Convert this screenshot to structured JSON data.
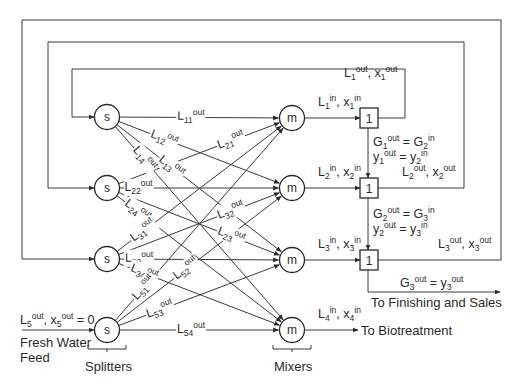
{
  "diagram": {
    "splitters": [
      {
        "id": "s1",
        "label": "s",
        "cx": 107,
        "cy": 117
      },
      {
        "id": "s2",
        "label": "s",
        "cx": 107,
        "cy": 188
      },
      {
        "id": "s3",
        "label": "s",
        "cx": 107,
        "cy": 259
      },
      {
        "id": "s5",
        "label": "s",
        "cx": 107,
        "cy": 330
      }
    ],
    "mixers": [
      {
        "id": "m1",
        "label": "m",
        "cx": 292,
        "cy": 118
      },
      {
        "id": "m2",
        "label": "m",
        "cx": 292,
        "cy": 188
      },
      {
        "id": "m3",
        "label": "m",
        "cx": 292,
        "cy": 260
      },
      {
        "id": "m4",
        "label": "m",
        "cx": 292,
        "cy": 330
      }
    ],
    "stages": [
      {
        "id": "u1",
        "label": "1",
        "cx": 369,
        "cy": 118
      },
      {
        "id": "u2",
        "label": "1",
        "cx": 369,
        "cy": 188
      },
      {
        "id": "u3",
        "label": "1",
        "cx": 369,
        "cy": 260
      }
    ],
    "streams": [
      {
        "from": "s1",
        "to": "m1",
        "base": "L",
        "sub": "11",
        "sup": "out"
      },
      {
        "from": "s1",
        "to": "m2",
        "base": "L",
        "sub": "12",
        "sup": "out"
      },
      {
        "from": "s1",
        "to": "m3",
        "base": "L",
        "sub": "13",
        "sup": "out"
      },
      {
        "from": "s1",
        "to": "m4",
        "base": "L",
        "sub": "14",
        "sup": "out"
      },
      {
        "from": "s2",
        "to": "m1",
        "base": "L",
        "sub": "21",
        "sup": "out"
      },
      {
        "from": "s2",
        "to": "m2",
        "base": "L",
        "sub": "22",
        "sup": "out"
      },
      {
        "from": "s2",
        "to": "m3",
        "base": "L",
        "sub": "23",
        "sup": "out"
      },
      {
        "from": "s2",
        "to": "m4",
        "base": "L",
        "sub": "24",
        "sup": "out"
      },
      {
        "from": "s3",
        "to": "m1",
        "base": "L",
        "sub": "31",
        "sup": "out"
      },
      {
        "from": "s3",
        "to": "m2",
        "base": "L",
        "sub": "32",
        "sup": "out"
      },
      {
        "from": "s3",
        "to": "m3",
        "base": "L",
        "sub": "33",
        "sup": "out"
      },
      {
        "from": "s3",
        "to": "m4",
        "base": "L",
        "sub": "34",
        "sup": "out"
      },
      {
        "from": "s5",
        "to": "m1",
        "base": "L",
        "sub": "51",
        "sup": "out"
      },
      {
        "from": "s5",
        "to": "m2",
        "base": "L",
        "sub": "52",
        "sup": "out"
      },
      {
        "from": "s5",
        "to": "m3",
        "base": "L",
        "sub": "53",
        "sup": "out"
      },
      {
        "from": "s5",
        "to": "m4",
        "base": "L",
        "sub": "54",
        "sup": "out"
      }
    ],
    "labels": {
      "mixer_in_1": "L<sub>1</sub><sup>in</sup>, x<sub>1</sub><sup>in</sup>",
      "mixer_in_2": "L<sub>2</sub><sup>in</sup>, x<sub>2</sub><sup>in</sup>",
      "mixer_in_3": "L<sub>3</sub><sup>in</sup>, x<sub>3</sub><sup>in</sup>",
      "mixer_in_4": "L<sub>4</sub><sup>in</sup>, x<sub>4</sub><sup>in</sup>",
      "stage_out_1": "L<sub>1</sub><sup>out</sup>, x<sub>1</sub><sup>out</sup>",
      "stage_out_2": "L<sub>2</sub><sup>out</sup>, x<sub>2</sub><sup>out</sup>",
      "stage_out_3": "L<sub>3</sub><sup>out</sup>, x<sub>3</sub><sup>out</sup>",
      "gas_12_a": "G<sub>1</sub><sup>out</sup> = G<sub>2</sub><sup>in</sup>",
      "gas_12_b": "y<sub>1</sub><sup>out</sup> = y<sub>2</sub><sup>in</sup>",
      "gas_23_a": "G<sub>2</sub><sup>out</sup> = G<sub>3</sub><sup>in</sup>",
      "gas_23_b": "y<sub>2</sub><sup>out</sup> = y<sub>3</sub><sup>in</sup>",
      "gas_out": "G<sub>3</sub><sup>out</sup> = y<sub>3</sub><sup>out</sup>",
      "to_finishing": "To Finishing and Sales",
      "to_biotreatment": "To Biotreatment",
      "fresh_feed_eq": "L<sub>5</sub><sup>out</sup>, x<sub>5</sub><sup>out</sup> = 0",
      "fresh_feed_1": "Fresh Water",
      "fresh_feed_2": "Feed",
      "splitters_caption": "Splitters",
      "mixers_caption": "Mixers"
    }
  }
}
